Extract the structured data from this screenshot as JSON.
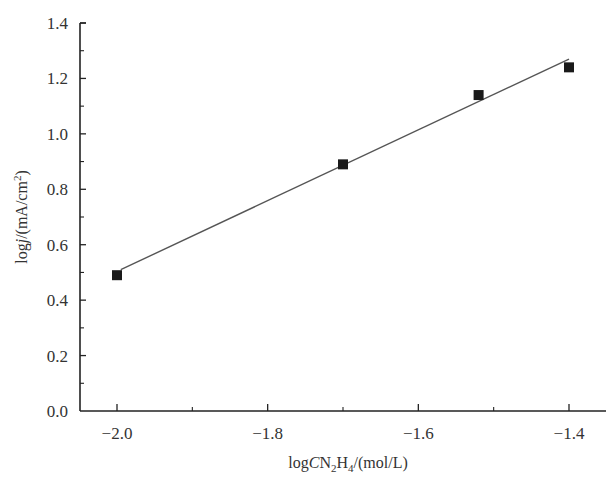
{
  "chart_data": {
    "type": "scatter",
    "title": "",
    "xlabel": "logCN2H4/(mol/L)",
    "ylabel": "logj/(mA/cm2)",
    "xlabel_parts": {
      "pre": "log",
      "italic": "C",
      "mid1": "N",
      "sub1": "2",
      "mid2": "H",
      "sub2": "4",
      "post": "/(mol/L)"
    },
    "ylabel_parts": {
      "pre": "log",
      "italic": "j",
      "mid": "/(mA/cm",
      "sup": "2",
      "post": ")"
    },
    "xlim": [
      -2.04,
      -1.35
    ],
    "ylim": [
      0.0,
      1.4
    ],
    "x_ticks": [
      -2.0,
      -1.8,
      -1.6,
      -1.4
    ],
    "x_tick_labels": [
      "−2.0",
      "−1.8",
      "−1.6",
      "−1.4"
    ],
    "y_ticks": [
      0.0,
      0.2,
      0.4,
      0.6,
      0.8,
      1.0,
      1.2,
      1.4
    ],
    "y_tick_labels": [
      "0.0",
      "0.2",
      "0.4",
      "0.6",
      "0.8",
      "1.0",
      "1.2",
      "1.4"
    ],
    "grid": false,
    "legend": null,
    "series": [
      {
        "name": "data",
        "marker": "square",
        "color": "#1a1a1a",
        "x": [
          -2.0,
          -1.7,
          -1.52,
          -1.4
        ],
        "y": [
          0.49,
          0.89,
          1.14,
          1.24
        ]
      },
      {
        "name": "linear fit",
        "style": "line",
        "color": "#555555",
        "x": [
          -1.995,
          -1.4
        ],
        "y": [
          0.51,
          1.27
        ]
      }
    ]
  }
}
